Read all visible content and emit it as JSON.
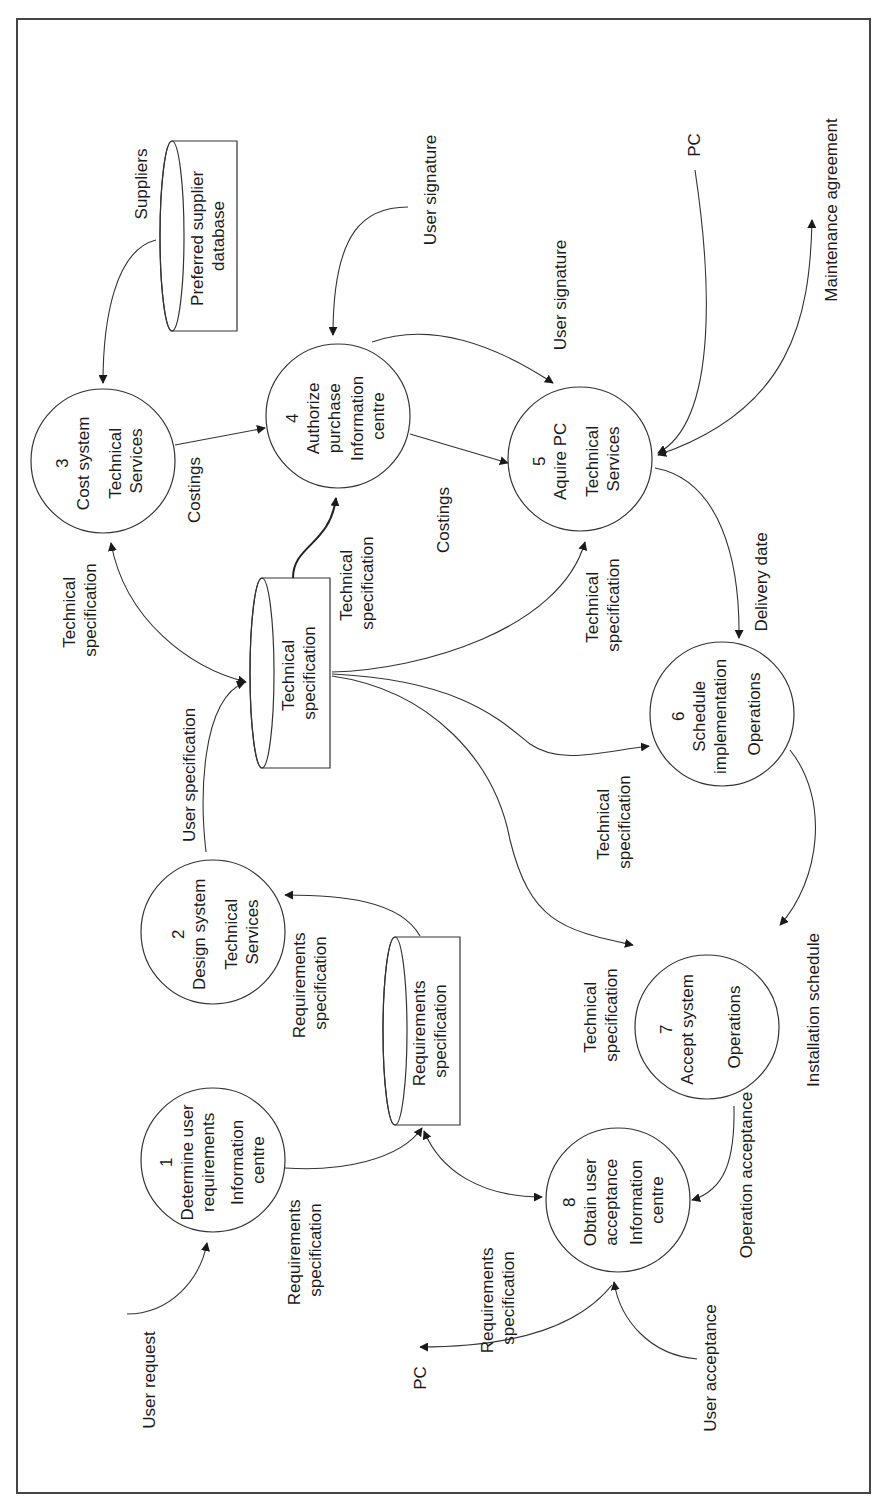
{
  "diagram": {
    "type": "data-flow-diagram",
    "orientation": "rotated-90-ccw",
    "colors": {
      "line": "#333333",
      "frame": "#444444",
      "background": "#ffffff",
      "text": "#1a1a1a"
    },
    "processes": [
      {
        "id": "1",
        "number": "1",
        "name_lines": [
          "Determine user",
          "requirements"
        ],
        "owner_lines": [
          "Information",
          "centre"
        ]
      },
      {
        "id": "2",
        "number": "2",
        "name_lines": [
          "Design system"
        ],
        "owner_lines": [
          "Technical",
          "Services"
        ]
      },
      {
        "id": "3",
        "number": "3",
        "name_lines": [
          "Cost system"
        ],
        "owner_lines": [
          "Technical",
          "Services"
        ]
      },
      {
        "id": "4",
        "number": "4",
        "name_lines": [
          "Authorize",
          "purchase"
        ],
        "owner_lines": [
          "Information",
          "centre"
        ]
      },
      {
        "id": "5",
        "number": "5",
        "name_lines": [
          "Aquire PC"
        ],
        "owner_lines": [
          "Technical",
          "Services"
        ]
      },
      {
        "id": "6",
        "number": "6",
        "name_lines": [
          "Schedule",
          "implementation"
        ],
        "owner_lines": [
          "Operations"
        ]
      },
      {
        "id": "7",
        "number": "7",
        "name_lines": [
          "Accept system"
        ],
        "owner_lines": [
          "Operations"
        ]
      },
      {
        "id": "8",
        "number": "8",
        "name_lines": [
          "Obtain user",
          "acceptance"
        ],
        "owner_lines": [
          "Information",
          "centre"
        ]
      }
    ],
    "datastores": [
      {
        "id": "preferred-supplier-db",
        "lines": [
          "Preferred supplier",
          "database"
        ]
      },
      {
        "id": "technical-spec-store",
        "lines": [
          "Technical",
          "specification"
        ]
      },
      {
        "id": "requirements-spec-store",
        "lines": [
          "Requirements",
          "specification"
        ]
      }
    ],
    "flows": [
      {
        "id": "f-user-request",
        "from": "external",
        "to": "1",
        "lines": [
          "User request"
        ]
      },
      {
        "id": "f-1-reqstore",
        "from": "1",
        "to": "requirements-spec-store",
        "lines": [
          "Requirements",
          "specification"
        ]
      },
      {
        "id": "f-reqstore-2",
        "from": "requirements-spec-store",
        "to": "2",
        "lines": [
          "Requirements",
          "specification"
        ]
      },
      {
        "id": "f-reqstore-8",
        "from": "requirements-spec-store",
        "to": "8",
        "bidirectional": true,
        "lines": [
          "Requirements",
          "specification"
        ]
      },
      {
        "id": "f-2-techstore",
        "from": "2",
        "to": "technical-spec-store",
        "lines": [
          "User specification"
        ]
      },
      {
        "id": "f-techstore-3",
        "from": "technical-spec-store",
        "to": "3",
        "bidirectional": true,
        "lines": [
          "Technical",
          "specification"
        ]
      },
      {
        "id": "f-suppliers",
        "from": "preferred-supplier-db",
        "to": "3",
        "lines": [
          "Suppliers"
        ]
      },
      {
        "id": "f-3-4",
        "from": "3",
        "to": "4",
        "lines": [
          "Costings"
        ]
      },
      {
        "id": "f-techstore-4",
        "from": "technical-spec-store",
        "to": "4",
        "lines": [
          "Technical",
          "specification"
        ]
      },
      {
        "id": "f-usersig-4",
        "from": "external",
        "to": "4",
        "lines": [
          "User signature"
        ]
      },
      {
        "id": "f-4-5-sig",
        "from": "4",
        "to": "5",
        "lines": [
          "User signature"
        ]
      },
      {
        "id": "f-4-5-cost",
        "from": "4",
        "to": "5",
        "lines": [
          "Costings"
        ]
      },
      {
        "id": "f-techstore-5",
        "from": "technical-spec-store",
        "to": "5",
        "lines": [
          "Technical",
          "specification"
        ]
      },
      {
        "id": "f-pc-5",
        "from": "external",
        "to": "5",
        "lines": [
          "PC"
        ]
      },
      {
        "id": "f-maint",
        "from": "5",
        "to": "external",
        "bidirectional": true,
        "lines": [
          "Maintenance agreement"
        ]
      },
      {
        "id": "f-5-6",
        "from": "5",
        "to": "6",
        "lines": [
          "Delivery date"
        ]
      },
      {
        "id": "f-techstore-6",
        "from": "technical-spec-store",
        "to": "6",
        "lines": [
          "Technical",
          "specification"
        ]
      },
      {
        "id": "f-techstore-7",
        "from": "technical-spec-store",
        "to": "7",
        "lines": [
          "Technical",
          "specification"
        ]
      },
      {
        "id": "f-6-7",
        "from": "6",
        "to": "7",
        "lines": [
          "Installation schedule"
        ]
      },
      {
        "id": "f-7-8",
        "from": "7",
        "to": "8",
        "lines": [
          "Operation acceptance"
        ]
      },
      {
        "id": "f-user-accept",
        "from": "external",
        "to": "8",
        "lines": [
          "User acceptance"
        ]
      },
      {
        "id": "f-8-pc",
        "from": "8",
        "to": "external",
        "lines": [
          "PC"
        ]
      }
    ]
  }
}
